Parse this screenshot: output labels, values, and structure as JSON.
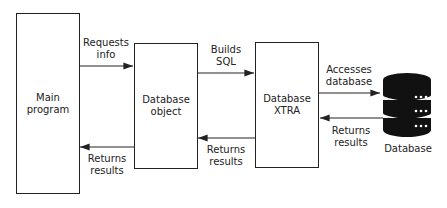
{
  "diagram": {
    "nodes": [
      {
        "id": "main",
        "label": "Main\nprogram"
      },
      {
        "id": "dbobj",
        "label": "Database\nobject"
      },
      {
        "id": "xtra",
        "label": "Database\nXTRA"
      },
      {
        "id": "db",
        "label": "Database",
        "icon": "database-icon"
      }
    ],
    "edges": [
      {
        "from": "main",
        "to": "dbobj",
        "label": "Requests\ninfo"
      },
      {
        "from": "dbobj",
        "to": "main",
        "label": "Returns\nresults"
      },
      {
        "from": "dbobj",
        "to": "xtra",
        "label": "Builds\nSQL"
      },
      {
        "from": "xtra",
        "to": "dbobj",
        "label": "Returns\nresults"
      },
      {
        "from": "xtra",
        "to": "db",
        "label": "Accesses\ndatabase"
      },
      {
        "from": "db",
        "to": "xtra",
        "label": "Returns\nresults"
      }
    ]
  }
}
